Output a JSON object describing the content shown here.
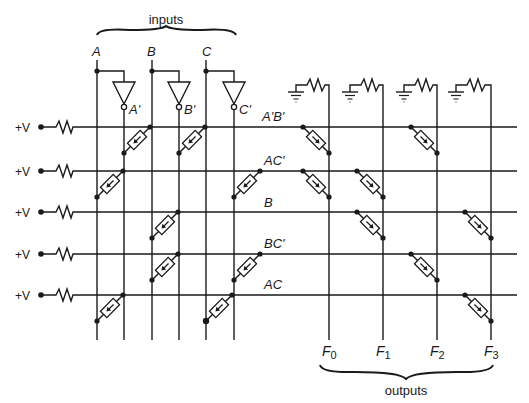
{
  "diagram": {
    "title_inputs": "inputs",
    "title_outputs": "outputs",
    "supply_label": "+V",
    "colors": {
      "ink": "#1a1a1a",
      "background": "#ffffff"
    },
    "inputs": [
      {
        "name": "A",
        "complement": "A'"
      },
      {
        "name": "B",
        "complement": "B'"
      },
      {
        "name": "C",
        "complement": "C'"
      }
    ],
    "product_terms": [
      "A'B'",
      "AC'",
      "B",
      "BC'",
      "AC"
    ],
    "outputs": [
      {
        "name": "F",
        "sub": "0"
      },
      {
        "name": "F",
        "sub": "1"
      },
      {
        "name": "F",
        "sub": "2"
      },
      {
        "name": "F",
        "sub": "3"
      }
    ],
    "and_array_connections": {
      "A'B'": [
        "A'",
        "B'"
      ],
      "AC'": [
        "A",
        "C'"
      ],
      "B": [
        "B"
      ],
      "BC'": [
        "B",
        "C'"
      ],
      "AC": [
        "A",
        "C"
      ]
    },
    "or_array_connections": {
      "F0": [
        "A'B'",
        "AC'"
      ],
      "F1": [
        "AC'",
        "B",
        "BC'"
      ],
      "F2": [
        "A'B'",
        "BC'"
      ],
      "F3": [
        "B",
        "AC"
      ]
    }
  }
}
